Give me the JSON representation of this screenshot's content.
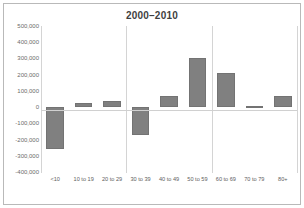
{
  "chart_data": {
    "type": "bar",
    "title": "2000–2010",
    "xlabel": "",
    "ylabel": "",
    "categories": [
      "<10",
      "10 to 19",
      "20 to 29",
      "30 to 39",
      "40 to 49",
      "50 to 59",
      "60 to 69",
      "70 to 79",
      "80+"
    ],
    "values": [
      -260000,
      25000,
      35000,
      -170000,
      70000,
      305000,
      210000,
      8000,
      68000
    ],
    "ylim": [
      -400000,
      500000
    ],
    "ytick_values": [
      500000,
      400000,
      300000,
      200000,
      100000,
      0,
      -100000,
      -200000,
      -300000,
      -400000
    ],
    "ytick_labels": [
      "500,000",
      "400,000",
      "300,000",
      "200,000",
      "100,000",
      "0",
      "-100,000",
      "-200,000",
      "-300,000",
      "-400,000"
    ],
    "grid": "vertical-group-separators",
    "legend": null,
    "bar_color": "#808080",
    "group_separator_after": [
      2,
      5,
      8
    ]
  },
  "frame": {
    "border_color": "#b9b9b9",
    "background": "#ffffff"
  }
}
